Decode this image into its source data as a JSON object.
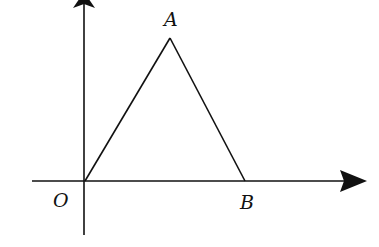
{
  "diagram": {
    "type": "coordinate-geometry",
    "colors": {
      "stroke": "#111111",
      "background": "#ffffff"
    },
    "axes": {
      "x_axis": {
        "direction": "right",
        "arrow": true
      },
      "y_axis": {
        "direction": "up",
        "arrow": true
      }
    },
    "points": [
      {
        "name": "O",
        "label": "O",
        "role": "origin"
      },
      {
        "name": "A",
        "label": "A",
        "role": "apex"
      },
      {
        "name": "B",
        "label": "B",
        "role": "on-x-axis"
      }
    ],
    "segments": [
      "OA",
      "AB",
      "OB"
    ],
    "labels": {
      "O": "O",
      "A": "A",
      "B": "B"
    }
  }
}
